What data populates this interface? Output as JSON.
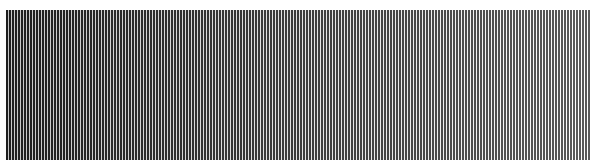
{
  "pattern": {
    "type": "vertical-stripes",
    "region": {
      "x": 6,
      "y": 10,
      "width": 584,
      "height": 150
    },
    "period_px": 3,
    "dark_px": 2,
    "background": "#ffffff",
    "dark_color_left": "#1e1e1e",
    "dark_color_right": "#5a5a5a",
    "light_color_left": "#c8c8c8",
    "light_color_right": "#ffffff"
  }
}
